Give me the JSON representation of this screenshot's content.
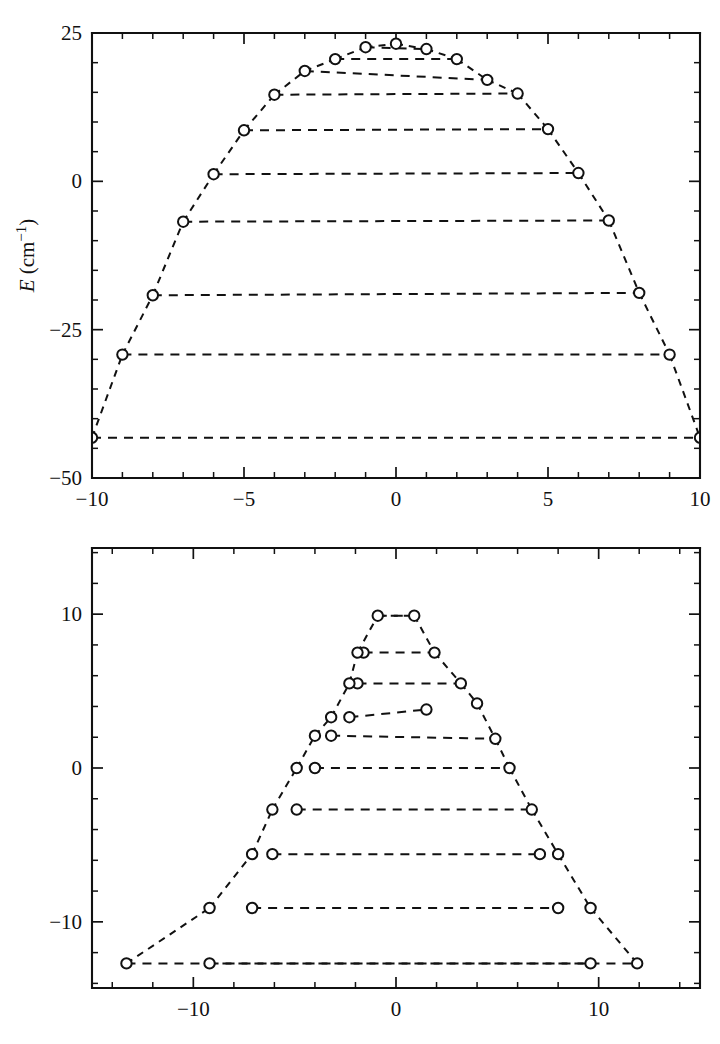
{
  "figure": {
    "background_color": "#ffffff",
    "line_color": "#111111",
    "marker_fill": "#ffffff"
  },
  "chart_data": [
    {
      "type": "line",
      "panel_id": "top-panel",
      "title": "",
      "xlabel": "",
      "ylabel": "E (cm−1)",
      "ylabel_symbol": "E",
      "ylabel_unit": "cm",
      "ylabel_exponent": "−1",
      "xlim": [
        -10,
        10
      ],
      "ylim": [
        -50,
        25
      ],
      "grid": false,
      "legend": null,
      "x_major_ticks": [
        -10,
        -5,
        0,
        5,
        10
      ],
      "x_major_ticklabels": [
        "−10",
        "−5",
        "0",
        "5",
        "10"
      ],
      "x_minor_step": 1,
      "y_major_ticks": [
        -50,
        -25,
        0,
        25
      ],
      "y_major_ticklabels": [
        "−50",
        "−25",
        "0",
        "25"
      ],
      "y_minor_step": 5,
      "marker": "open-circle",
      "linestyle": "dashed",
      "description": "Rotational energy levels drawn as dashed horizontal rungs; each rung joins a left endpoint to a right endpoint, and successive rungs are joined by short dashed diagonal connectors forming an inverted-V envelope.",
      "rungs": [
        {
          "index": 1,
          "left": [
            -9.0,
            -29.2
          ],
          "right": [
            9.0,
            -29.2
          ]
        },
        {
          "index": 2,
          "left": [
            -8.0,
            -19.2
          ],
          "right": [
            8.0,
            -18.8
          ]
        },
        {
          "index": 3,
          "left": [
            -7.0,
            -6.8
          ],
          "right": [
            7.0,
            -6.6
          ]
        },
        {
          "index": 4,
          "left": [
            -6.0,
            1.2
          ],
          "right": [
            6.0,
            1.4
          ]
        },
        {
          "index": 5,
          "left": [
            -5.0,
            8.6
          ],
          "right": [
            5.0,
            8.8
          ]
        },
        {
          "index": 6,
          "left": [
            -4.0,
            14.6
          ],
          "right": [
            4.0,
            14.8
          ]
        },
        {
          "index": 7,
          "left": [
            -3.0,
            18.6
          ],
          "right": [
            3.0,
            17.1
          ]
        },
        {
          "index": 8,
          "left": [
            -2.0,
            20.6
          ],
          "right": [
            2.0,
            20.6
          ]
        },
        {
          "index": 9,
          "left": [
            -1.0,
            22.6
          ],
          "right": [
            1.0,
            22.3
          ]
        },
        {
          "index": 10,
          "left": [
            0.0,
            23.2
          ],
          "right": [
            0.0,
            23.2
          ]
        }
      ],
      "bottom_rung": {
        "left": [
          -10.0,
          -43.2
        ],
        "right": [
          10.0,
          -43.2
        ]
      },
      "connectors": [
        {
          "from": [
            -10.0,
            -43.2
          ],
          "to": [
            -9.0,
            -29.2
          ]
        },
        {
          "from": [
            -9.0,
            -29.2
          ],
          "to": [
            -8.0,
            -19.2
          ]
        },
        {
          "from": [
            -8.0,
            -19.2
          ],
          "to": [
            -7.0,
            -6.8
          ]
        },
        {
          "from": [
            -7.0,
            -6.8
          ],
          "to": [
            -6.0,
            1.2
          ]
        },
        {
          "from": [
            -6.0,
            1.2
          ],
          "to": [
            -5.0,
            8.6
          ]
        },
        {
          "from": [
            -5.0,
            8.6
          ],
          "to": [
            -4.0,
            14.6
          ]
        },
        {
          "from": [
            -4.0,
            14.6
          ],
          "to": [
            -3.0,
            18.6
          ]
        },
        {
          "from": [
            -3.0,
            18.6
          ],
          "to": [
            -2.0,
            20.6
          ]
        },
        {
          "from": [
            -2.0,
            20.6
          ],
          "to": [
            -1.0,
            22.6
          ]
        },
        {
          "from": [
            -1.0,
            22.6
          ],
          "to": [
            0.0,
            23.2
          ]
        },
        {
          "from": [
            0.0,
            23.2
          ],
          "to": [
            1.0,
            22.3
          ]
        },
        {
          "from": [
            1.0,
            22.3
          ],
          "to": [
            2.0,
            20.6
          ]
        },
        {
          "from": [
            2.0,
            20.6
          ],
          "to": [
            3.0,
            17.1
          ]
        },
        {
          "from": [
            3.0,
            17.1
          ],
          "to": [
            4.0,
            14.8
          ]
        },
        {
          "from": [
            4.0,
            14.8
          ],
          "to": [
            5.0,
            8.8
          ]
        },
        {
          "from": [
            5.0,
            8.8
          ],
          "to": [
            6.0,
            1.4
          ]
        },
        {
          "from": [
            6.0,
            1.4
          ],
          "to": [
            7.0,
            -6.6
          ]
        },
        {
          "from": [
            7.0,
            -6.6
          ],
          "to": [
            8.0,
            -18.8
          ]
        },
        {
          "from": [
            8.0,
            -18.8
          ],
          "to": [
            9.0,
            -29.2
          ]
        },
        {
          "from": [
            9.0,
            -29.2
          ],
          "to": [
            10.0,
            -43.2
          ]
        }
      ]
    },
    {
      "type": "line",
      "panel_id": "bottom-panel",
      "title": "",
      "xlabel": "",
      "ylabel": "",
      "xlim": [
        -15,
        15
      ],
      "ylim": [
        -14.3,
        14.3
      ],
      "grid": false,
      "legend": null,
      "x_major_ticks": [
        -10,
        0,
        10
      ],
      "x_major_ticklabels": [
        "−10",
        "0",
        "10"
      ],
      "x_minor_step": 2,
      "y_major_ticks": [
        -10,
        0,
        10
      ],
      "y_major_ticklabels": [
        "−10",
        "0",
        "10"
      ],
      "y_minor_step": 2,
      "marker": "open-circle",
      "linestyle": "dashed",
      "description": "Second energy level correlation diagram with dashed horizontal rungs joined by dashed diagonal connectors, forming an asymmetric inverted-V envelope.",
      "rungs": [
        {
          "index": 1,
          "left": [
            -9.2,
            -12.7
          ],
          "right": [
            9.6,
            -12.7
          ]
        },
        {
          "index": 2,
          "left": [
            -7.1,
            -9.1
          ],
          "right": [
            8.0,
            -9.1
          ]
        },
        {
          "index": 3,
          "left": [
            -6.1,
            -5.6
          ],
          "right": [
            7.1,
            -5.6
          ]
        },
        {
          "index": 4,
          "left": [
            -4.9,
            -2.7
          ],
          "right": [
            6.7,
            -2.7
          ]
        },
        {
          "index": 5,
          "left": [
            -4.0,
            0.0
          ],
          "right": [
            5.6,
            0.0
          ]
        },
        {
          "index": 6,
          "left": [
            -3.2,
            2.1
          ],
          "right": [
            4.9,
            1.9
          ]
        },
        {
          "index": 7,
          "left": [
            -2.3,
            3.3
          ],
          "right": [
            1.5,
            3.8
          ]
        },
        {
          "index": 8,
          "left": [
            -1.9,
            5.5
          ],
          "right": [
            3.2,
            5.5
          ]
        },
        {
          "index": 9,
          "left": [
            -1.6,
            7.5
          ],
          "right": [
            1.9,
            7.5
          ]
        },
        {
          "index": 10,
          "left": [
            -0.9,
            9.9
          ],
          "right": [
            0.9,
            9.9
          ]
        }
      ],
      "bottom_rung": {
        "left": [
          -13.3,
          -12.7
        ],
        "right": [
          11.9,
          -12.7
        ]
      },
      "connectors": [
        {
          "from": [
            -13.3,
            -12.7
          ],
          "to": [
            -9.2,
            -9.1
          ]
        },
        {
          "from": [
            -9.2,
            -9.1
          ],
          "to": [
            -7.1,
            -5.6
          ]
        },
        {
          "from": [
            -7.1,
            -5.6
          ],
          "to": [
            -6.1,
            -2.7
          ]
        },
        {
          "from": [
            -6.1,
            -2.7
          ],
          "to": [
            -4.9,
            0.0
          ]
        },
        {
          "from": [
            -4.9,
            0.0
          ],
          "to": [
            -4.0,
            2.1
          ]
        },
        {
          "from": [
            -4.0,
            2.1
          ],
          "to": [
            -3.2,
            3.3
          ]
        },
        {
          "from": [
            -3.2,
            3.3
          ],
          "to": [
            -2.3,
            5.5
          ]
        },
        {
          "from": [
            -2.3,
            5.5
          ],
          "to": [
            -1.9,
            7.5
          ]
        },
        {
          "from": [
            -1.9,
            7.5
          ],
          "to": [
            -0.9,
            9.9
          ]
        },
        {
          "from": [
            -0.9,
            9.9
          ],
          "to": [
            0.9,
            9.9
          ]
        },
        {
          "from": [
            0.9,
            9.9
          ],
          "to": [
            1.9,
            7.5
          ]
        },
        {
          "from": [
            1.9,
            7.5
          ],
          "to": [
            3.2,
            5.5
          ]
        },
        {
          "from": [
            3.2,
            5.5
          ],
          "to": [
            4.0,
            4.2
          ]
        },
        {
          "from": [
            4.0,
            4.2
          ],
          "to": [
            4.9,
            1.9
          ]
        },
        {
          "from": [
            4.9,
            1.9
          ],
          "to": [
            5.6,
            0.0
          ]
        },
        {
          "from": [
            5.6,
            0.0
          ],
          "to": [
            6.7,
            -2.7
          ]
        },
        {
          "from": [
            6.7,
            -2.7
          ],
          "to": [
            8.0,
            -5.6
          ]
        },
        {
          "from": [
            8.0,
            -5.6
          ],
          "to": [
            9.6,
            -9.1
          ]
        },
        {
          "from": [
            9.6,
            -9.1
          ],
          "to": [
            11.9,
            -12.7
          ]
        }
      ],
      "extra_points": [
        {
          "x": 1.5,
          "y": 3.8
        },
        {
          "x": 4.0,
          "y": 4.2
        }
      ]
    }
  ]
}
